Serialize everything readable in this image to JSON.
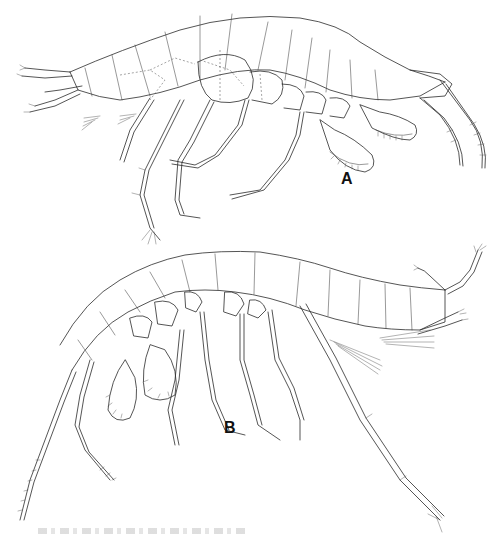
{
  "figure": {
    "type": "scientific line illustration",
    "panels": [
      {
        "id": "A",
        "label": "A",
        "orientation": "head facing right, dorsal arch upward",
        "position": "top"
      },
      {
        "id": "B",
        "label": "B",
        "orientation": "head facing left-down, body arched, pleon to right",
        "position": "bottom"
      }
    ],
    "caption": {
      "text": "",
      "legible": false
    }
  },
  "colors": {
    "background": "#ffffff",
    "ink": "#2a2a2a"
  }
}
